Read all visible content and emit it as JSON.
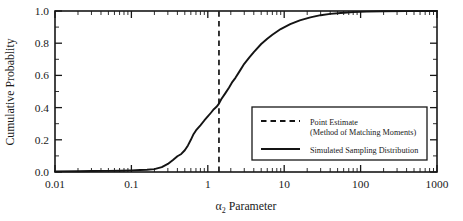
{
  "chart_data": {
    "type": "line",
    "title": "",
    "xlabel": "α₂ Parameter",
    "ylabel": "Cumulative Probablity",
    "xscale": "log",
    "xlim": [
      0.01,
      1000
    ],
    "ylim": [
      0.0,
      1.0
    ],
    "grid": false,
    "xticks": [
      "0.01",
      "0.1",
      "1",
      "10",
      "100",
      "1000"
    ],
    "xtick_values": [
      0.01,
      0.1,
      1,
      10,
      100,
      1000
    ],
    "yticks": [
      "0.0",
      "0.2",
      "0.4",
      "0.6",
      "0.8",
      "1.0"
    ],
    "ytick_values": [
      0.0,
      0.2,
      0.4,
      0.6,
      0.8,
      1.0
    ],
    "legend_position": "lower right",
    "annotations": [
      {
        "name": "point-estimate-line",
        "kind": "vertical-dashed-line",
        "x": 1.4,
        "label": "Point Estimate (Method of Matching Moments)"
      }
    ],
    "series": [
      {
        "name": "Simulated Sampling Distribution",
        "style": "solid",
        "color": "#141414",
        "x": [
          0.01,
          0.02,
          0.03,
          0.05,
          0.07,
          0.1,
          0.13,
          0.16,
          0.2,
          0.25,
          0.3,
          0.35,
          0.4,
          0.45,
          0.5,
          0.55,
          0.6,
          0.65,
          0.7,
          0.8,
          0.9,
          1.0,
          1.1,
          1.2,
          1.3,
          1.4,
          1.5,
          1.7,
          1.9,
          2.1,
          2.3,
          2.6,
          3.0,
          3.5,
          4.0,
          5.0,
          6.0,
          7.0,
          9.0,
          12.0,
          16.0,
          22.0,
          30.0,
          40.0,
          55.0,
          80.0,
          120.0,
          200.0,
          400.0,
          1000.0
        ],
        "y": [
          0.004,
          0.005,
          0.006,
          0.007,
          0.008,
          0.01,
          0.012,
          0.014,
          0.018,
          0.03,
          0.05,
          0.075,
          0.098,
          0.112,
          0.135,
          0.165,
          0.2,
          0.235,
          0.258,
          0.29,
          0.32,
          0.345,
          0.368,
          0.39,
          0.405,
          0.425,
          0.452,
          0.49,
          0.525,
          0.56,
          0.585,
          0.625,
          0.672,
          0.712,
          0.745,
          0.795,
          0.828,
          0.852,
          0.888,
          0.918,
          0.942,
          0.96,
          0.974,
          0.982,
          0.988,
          0.993,
          0.996,
          0.998,
          0.999,
          1.0
        ]
      }
    ],
    "legend": [
      {
        "marker": "dashed",
        "label_line1": "Point Estimate",
        "label_line2": "(Method of Matching Moments)"
      },
      {
        "marker": "solid",
        "label_line1": "Simulated Sampling Distribution",
        "label_line2": ""
      }
    ]
  }
}
